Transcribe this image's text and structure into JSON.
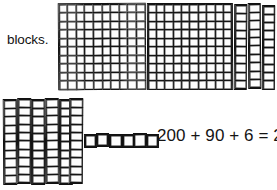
{
  "page": {
    "kind": "base-ten-blocks-worksheet",
    "background_color": "#ffffff",
    "ink_color": "#111111"
  },
  "label": {
    "text": "blocks."
  },
  "equation": {
    "text": "200 + 90 + 6 = 296",
    "hundreds": "200",
    "tens": "90",
    "ones": "6",
    "sum": "296"
  },
  "manipulatives": {
    "hundreds_flats": {
      "count": 2,
      "grid_rows": 10,
      "grid_cols": 10,
      "value_each": 100,
      "total_value": 200
    },
    "tens_rods": {
      "count": 9,
      "cells_each": 10,
      "value_each": 10,
      "total_value": 90,
      "groups": [
        {
          "name": "top-right-loose-rods",
          "count": 3
        },
        {
          "name": "bottom-left-rods",
          "count": 6
        }
      ]
    },
    "ones_units": {
      "count": 6,
      "value_each": 1,
      "total_value": 6
    }
  }
}
